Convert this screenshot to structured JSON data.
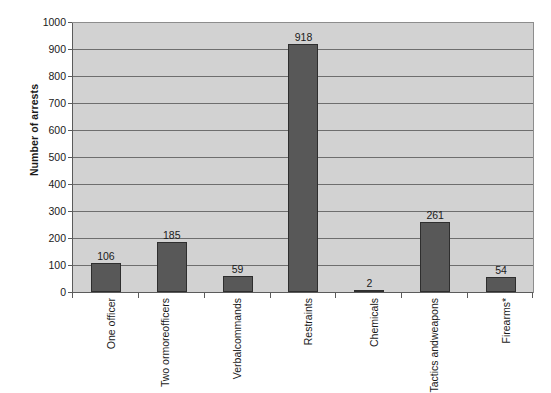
{
  "chart_data": {
    "type": "bar",
    "title": "",
    "subtitle": "",
    "xlabel": "",
    "ylabel": "Number of arrests",
    "ylim": [
      0,
      1000
    ],
    "ytick_step": 100,
    "grid": true,
    "legend": false,
    "orientation": "vertical",
    "categories": [
      "One officer",
      "Two or more officers",
      "Verbal commands",
      "Restraints",
      "Chemicals",
      "Tactics and weapons",
      "Firearms*"
    ],
    "category_lines": [
      [
        "One officer"
      ],
      [
        "Two or",
        "more",
        "officers"
      ],
      [
        "Verbal",
        "commands"
      ],
      [
        "Restraints"
      ],
      [
        "Chemicals"
      ],
      [
        "Tactics and",
        "weapons"
      ],
      [
        "Firearms*"
      ]
    ],
    "values": [
      106,
      185,
      59,
      918,
      2,
      261,
      54
    ],
    "value_labels": [
      "106",
      "185",
      "59",
      "918",
      "2",
      "261",
      "54"
    ],
    "yticks": [
      0,
      100,
      200,
      300,
      400,
      500,
      600,
      700,
      800,
      900,
      1000
    ],
    "ytick_labels": [
      "0",
      "100",
      "200",
      "300",
      "400",
      "500",
      "600",
      "700",
      "800",
      "900",
      "1000"
    ],
    "colors": {
      "bar_fill": "#585858",
      "bar_border": "#2e2e2e",
      "plot_background": "#d2d2d2",
      "gridline": "#6e6e6e",
      "axis": "#5b5b5b",
      "text": "#1a1a1a",
      "page_background": "#ffffff"
    }
  }
}
